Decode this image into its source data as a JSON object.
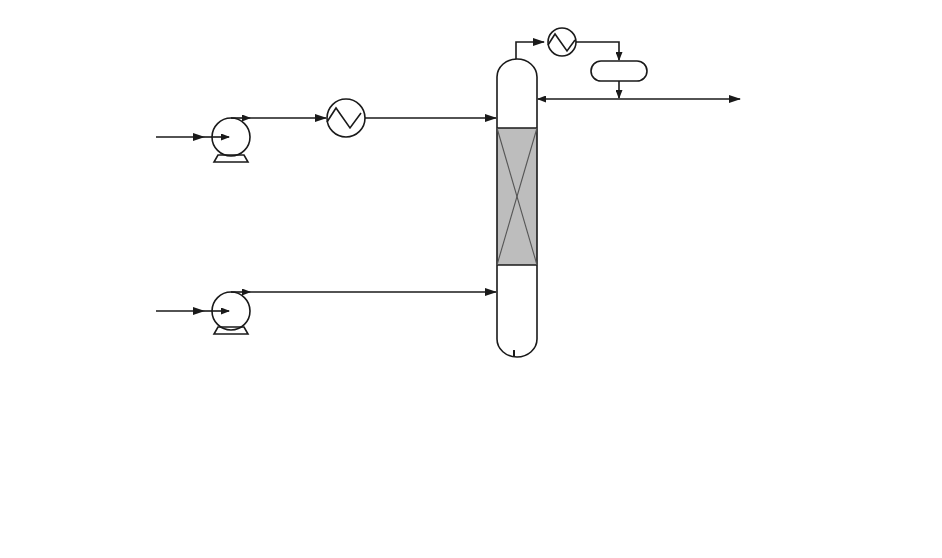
{
  "diagram": {
    "type": "process-flow",
    "colors": {
      "line": "#1a1a1a",
      "packing": "#bdbdbd",
      "background": "#ffffff"
    },
    "labels": {
      "palm_oil_feed": "Palm Oil Feed",
      "methanol_feed": "Methanol Feed",
      "methanol": "Methanol",
      "rectifying": "Rectifying",
      "reaction": "Reaction",
      "stripping": "Stripping",
      "reactive_distillation": "Reactive Distillation",
      "decanter": "Decanter",
      "glycerol": "Glycerol",
      "biodiesel": "Biodiesel"
    },
    "nodes": [
      {
        "id": "pump-palm-oil",
        "kind": "pump"
      },
      {
        "id": "preheater-palm-oil",
        "kind": "heat-exchanger"
      },
      {
        "id": "pump-methanol",
        "kind": "pump"
      },
      {
        "id": "reactive-distillation-column",
        "kind": "column",
        "sections": [
          "Rectifying",
          "Reaction",
          "Stripping"
        ]
      },
      {
        "id": "condenser",
        "kind": "heat-exchanger"
      },
      {
        "id": "reflux-drum",
        "kind": "drum"
      },
      {
        "id": "reboiler",
        "kind": "heat-exchanger"
      },
      {
        "id": "bottoms-cooler",
        "kind": "heat-exchanger"
      },
      {
        "id": "decanter",
        "kind": "decanter"
      }
    ],
    "edges": [
      {
        "from": "Palm Oil Feed",
        "to": "pump-palm-oil"
      },
      {
        "from": "pump-palm-oil",
        "to": "preheater-palm-oil"
      },
      {
        "from": "preheater-palm-oil",
        "to": "reactive-distillation-column"
      },
      {
        "from": "Methanol Feed",
        "to": "pump-methanol"
      },
      {
        "from": "pump-methanol",
        "to": "reactive-distillation-column"
      },
      {
        "from": "reactive-distillation-column",
        "to": "condenser"
      },
      {
        "from": "condenser",
        "to": "reflux-drum"
      },
      {
        "from": "reflux-drum",
        "to": "reactive-distillation-column"
      },
      {
        "from": "reflux-drum",
        "to": "Methanol"
      },
      {
        "from": "reactive-distillation-column",
        "to": "reboiler"
      },
      {
        "from": "reboiler",
        "to": "reactive-distillation-column"
      },
      {
        "from": "reboiler",
        "to": "bottoms-cooler"
      },
      {
        "from": "bottoms-cooler",
        "to": "decanter"
      },
      {
        "from": "decanter",
        "to": "Glycerol"
      },
      {
        "from": "decanter",
        "to": "Biodiesel"
      }
    ]
  }
}
